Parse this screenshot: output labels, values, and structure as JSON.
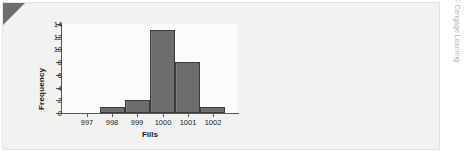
{
  "figure": {
    "credit": "© Cengage Learning",
    "top_clipped_text": "",
    "panel_color": "#f2f2f0",
    "bar_color": "#6d6d6d",
    "bar_edge_color": "#3a3a3a",
    "axis_color": "#585858"
  },
  "chart_data": {
    "type": "bar",
    "title": "",
    "subtitle": "",
    "xlabel": "Fills",
    "ylabel": "Frequency",
    "categories": [
      "997",
      "998",
      "999",
      "1000",
      "1001",
      "1002"
    ],
    "values": [
      0,
      1,
      2,
      13,
      8,
      1
    ],
    "xtick_labels": [
      "997",
      "998",
      "999",
      "1000",
      "1001",
      "1002"
    ],
    "ytick_labels": [
      "0",
      "2",
      "4",
      "6",
      "8",
      "10",
      "12",
      "14"
    ],
    "ytick_values": [
      0,
      2,
      4,
      6,
      8,
      10,
      12,
      14
    ],
    "ylim": [
      0,
      14
    ],
    "grid": false,
    "legend": null,
    "legend_position": "none",
    "annotations": []
  }
}
